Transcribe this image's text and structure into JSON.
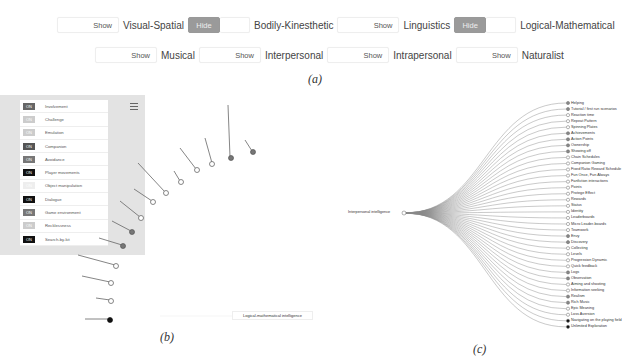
{
  "panel_a": {
    "caption": "(a)",
    "row1": [
      {
        "button": "Show",
        "label": "Visual-Spatial"
      },
      {
        "button": "Hide",
        "label": "Bodily-Kinesthetic"
      },
      {
        "button": "Show",
        "label": "Linguistics"
      },
      {
        "button": "Hide",
        "label": "Logical-Mathematical"
      }
    ],
    "row2": [
      {
        "button": "Show",
        "label": "Musical"
      },
      {
        "button": "Show",
        "label": "Interpersonal"
      },
      {
        "button": "Show",
        "label": "Intrapersonal"
      },
      {
        "button": "Show",
        "label": "Naturalist"
      }
    ]
  },
  "panel_b": {
    "caption": "(b)",
    "toggles": [
      {
        "state": "ON",
        "label": "Involvement",
        "color": "#666"
      },
      {
        "state": "ON",
        "label": "Challenge",
        "color": "#ccc"
      },
      {
        "state": "ON",
        "label": "Emulation",
        "color": "#ccc"
      },
      {
        "state": "ON",
        "label": "Companion",
        "color": "#555"
      },
      {
        "state": "ON",
        "label": "Avoidance",
        "color": "#777"
      },
      {
        "state": "ON",
        "label": "Player movements",
        "color": "#111"
      },
      {
        "state": "ON",
        "label": "Object manipulation",
        "color": "#eee"
      },
      {
        "state": "ON",
        "label": "Dialogue",
        "color": "#111"
      },
      {
        "state": "ON",
        "label": "Game environment",
        "color": "#777"
      },
      {
        "state": "ON",
        "label": "Recklessness",
        "color": "#ccc"
      },
      {
        "state": "ON",
        "label": "Search-by-kit",
        "color": "#111"
      }
    ],
    "radial_labels": [
      "Tutorial / first run scenarios",
      "Helping",
      "Logical thinking",
      "Spinning plates",
      "Levels",
      "Meaning / Learning",
      "Strategizing",
      "Repeat Pattern",
      "Micro-leaderboards",
      "Role Playing",
      "Aiming and shooting",
      "Physical Pattern",
      "Timing",
      "Cutscenes"
    ],
    "root_label": "Logical-mathematical intelligence"
  },
  "panel_c": {
    "caption": "(c)",
    "root_label": "Interpersonal intelligence",
    "leaves": [
      "Helping",
      "Tutorial / first run scenarios",
      "Reaction time",
      "Repeat Pattern",
      "Spinning Plates",
      "Achievements",
      "Action Points",
      "Ownership",
      "Showing off",
      "Chain Schedules",
      "Companion Gaming",
      "Fixed Ratio Reward Schedule",
      "Fun Once, Fun Always",
      "Fanfiction interactions",
      "Points",
      "Protege Effect",
      "Rewards",
      "Status",
      "Identity",
      "Leaderboards",
      "Micro Leader-boards",
      "Teamwork",
      "Envy",
      "Discovery",
      "Collecting",
      "Levels",
      "Progression Dynamic",
      "Quick feedback",
      "Logs",
      "Observation",
      "Aiming and shooting",
      "Information seeking",
      "Realism",
      "Rich Music",
      "Epic Meaning",
      "Loss Aversion",
      "Navigating on the playing field",
      "Unlimited Exploration"
    ]
  }
}
